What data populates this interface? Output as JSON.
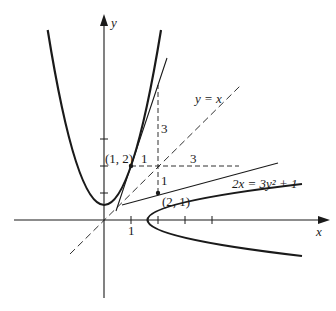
{
  "figure": {
    "axes": {
      "x_label": "x",
      "y_label": "y",
      "x_tick_label": "1"
    },
    "curves": {
      "parabola_label": "2x = 3y² + 1",
      "diagonal_label": "y = x"
    },
    "points": {
      "p1_label": "(1, 2)",
      "p2_label": "(2, 1)"
    },
    "slope_triangles": {
      "t1_run": "1",
      "t1_rise": "3",
      "t2_rise": "1",
      "t2_run": "3"
    },
    "colors": {
      "ink": "#1a1a1a",
      "background": "#ffffff"
    }
  }
}
